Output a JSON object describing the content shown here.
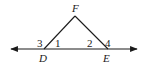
{
  "diagram": {
    "type": "geometry",
    "points": {
      "F": {
        "label": "F",
        "x": 75,
        "y": 16
      },
      "D": {
        "label": "D",
        "x": 44,
        "y": 49
      },
      "E": {
        "label": "E",
        "x": 108,
        "y": 49
      }
    },
    "line": {
      "x1": 10,
      "x2": 138,
      "y": 49,
      "arrows": "both"
    },
    "angles": [
      {
        "label": "1",
        "at": "D",
        "position": "interior"
      },
      {
        "label": "2",
        "at": "E",
        "position": "interior"
      },
      {
        "label": "3",
        "at": "D",
        "position": "exterior"
      },
      {
        "label": "4",
        "at": "E",
        "position": "exterior"
      }
    ],
    "stroke_color": "#1a1a1a"
  }
}
